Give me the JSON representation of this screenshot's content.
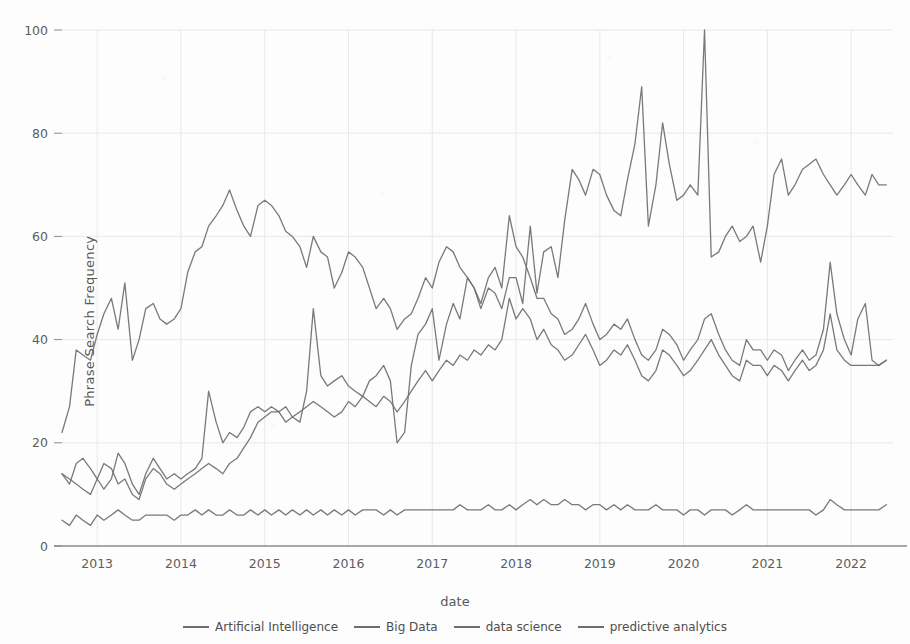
{
  "chart_data": {
    "type": "line",
    "title": "",
    "xlabel": "date",
    "ylabel": "Phrase Search Frequency",
    "ylim": [
      0,
      104
    ],
    "yticks": [
      0,
      20,
      40,
      60,
      80,
      100
    ],
    "xticks": [
      "2013",
      "2014",
      "2015",
      "2016",
      "2017",
      "2018",
      "2019",
      "2020",
      "2021",
      "2022"
    ],
    "xlim": [
      2012.58,
      2022.5
    ],
    "grid": true,
    "legend_position": "bottom",
    "line_color": "#6e6e6e",
    "axis_color": "#8a8a8a",
    "grid_color": "#e8e8e8",
    "background": "#fdfdfd",
    "x": [
      2012.58,
      2012.67,
      2012.75,
      2012.83,
      2012.92,
      2013.0,
      2013.08,
      2013.17,
      2013.25,
      2013.33,
      2013.42,
      2013.5,
      2013.58,
      2013.67,
      2013.75,
      2013.83,
      2013.92,
      2014.0,
      2014.08,
      2014.17,
      2014.25,
      2014.33,
      2014.42,
      2014.5,
      2014.58,
      2014.67,
      2014.75,
      2014.83,
      2014.92,
      2015.0,
      2015.08,
      2015.17,
      2015.25,
      2015.33,
      2015.42,
      2015.5,
      2015.58,
      2015.67,
      2015.75,
      2015.83,
      2015.92,
      2016.0,
      2016.08,
      2016.17,
      2016.25,
      2016.33,
      2016.42,
      2016.5,
      2016.58,
      2016.67,
      2016.75,
      2016.83,
      2016.92,
      2017.0,
      2017.08,
      2017.17,
      2017.25,
      2017.33,
      2017.42,
      2017.5,
      2017.58,
      2017.67,
      2017.75,
      2017.83,
      2017.92,
      2018.0,
      2018.08,
      2018.17,
      2018.25,
      2018.33,
      2018.42,
      2018.5,
      2018.58,
      2018.67,
      2018.75,
      2018.83,
      2018.92,
      2019.0,
      2019.08,
      2019.17,
      2019.25,
      2019.33,
      2019.42,
      2019.5,
      2019.58,
      2019.67,
      2019.75,
      2019.83,
      2019.92,
      2020.0,
      2020.08,
      2020.17,
      2020.25,
      2020.33,
      2020.42,
      2020.5,
      2020.58,
      2020.67,
      2020.75,
      2020.83,
      2020.92,
      2021.0,
      2021.08,
      2021.17,
      2021.25,
      2021.33,
      2021.42,
      2021.5,
      2021.58,
      2021.67,
      2021.75,
      2021.83,
      2021.92,
      2022.0,
      2022.08,
      2022.17,
      2022.25,
      2022.33,
      2022.42
    ],
    "series": [
      {
        "name": "Artificial Intelligence",
        "values": [
          14,
          12,
          16,
          17,
          15,
          13,
          11,
          13,
          18,
          16,
          12,
          10,
          14,
          17,
          15,
          13,
          14,
          13,
          14,
          15,
          17,
          30,
          24,
          20,
          22,
          21,
          23,
          26,
          27,
          26,
          27,
          26,
          24,
          25,
          24,
          30,
          46,
          33,
          31,
          32,
          33,
          31,
          30,
          29,
          32,
          33,
          35,
          32,
          20,
          22,
          35,
          41,
          43,
          46,
          36,
          43,
          47,
          44,
          52,
          50,
          46,
          50,
          49,
          46,
          52,
          52,
          47,
          62,
          49,
          57,
          58,
          52,
          63,
          73,
          71,
          68,
          73,
          72,
          68,
          65,
          64,
          71,
          78,
          89,
          62,
          70,
          82,
          74,
          67,
          68,
          70,
          68,
          100,
          56,
          57,
          60,
          62,
          59,
          60,
          62,
          55,
          62,
          72,
          75,
          68,
          70,
          73,
          74,
          75,
          72,
          70,
          68,
          70,
          72,
          70,
          68,
          72,
          70,
          70
        ]
      },
      {
        "name": "Big Data",
        "values": [
          22,
          27,
          38,
          37,
          36,
          41,
          45,
          48,
          42,
          51,
          36,
          40,
          46,
          47,
          44,
          43,
          44,
          46,
          53,
          57,
          58,
          62,
          64,
          66,
          69,
          65,
          62,
          60,
          66,
          67,
          66,
          64,
          61,
          60,
          58,
          54,
          60,
          57,
          56,
          50,
          53,
          57,
          56,
          54,
          50,
          46,
          48,
          46,
          42,
          44,
          45,
          48,
          52,
          50,
          55,
          58,
          57,
          54,
          52,
          50,
          47,
          52,
          54,
          50,
          64,
          58,
          56,
          52,
          48,
          48,
          45,
          44,
          41,
          42,
          44,
          47,
          43,
          40,
          41,
          43,
          42,
          44,
          40,
          37,
          36,
          38,
          42,
          41,
          39,
          36,
          38,
          40,
          44,
          45,
          41,
          38,
          36,
          35,
          40,
          38,
          38,
          36,
          38,
          37,
          34,
          36,
          38,
          36,
          37,
          42,
          55,
          45,
          40,
          37,
          44,
          47,
          36,
          35,
          36
        ]
      },
      {
        "name": "data science",
        "values": [
          14,
          13,
          12,
          11,
          10,
          13,
          16,
          15,
          12,
          13,
          10,
          9,
          13,
          15,
          14,
          12,
          11,
          12,
          13,
          14,
          15,
          16,
          15,
          14,
          16,
          17,
          19,
          21,
          24,
          25,
          26,
          26,
          27,
          25,
          26,
          27,
          28,
          27,
          26,
          25,
          26,
          28,
          27,
          29,
          28,
          27,
          29,
          28,
          26,
          28,
          30,
          32,
          34,
          32,
          34,
          36,
          35,
          37,
          36,
          38,
          37,
          39,
          38,
          40,
          48,
          44,
          46,
          44,
          40,
          42,
          39,
          38,
          36,
          37,
          39,
          41,
          38,
          35,
          36,
          38,
          37,
          39,
          36,
          33,
          32,
          34,
          38,
          37,
          35,
          33,
          34,
          36,
          38,
          40,
          37,
          35,
          33,
          32,
          36,
          35,
          35,
          33,
          35,
          34,
          32,
          34,
          36,
          34,
          35,
          38,
          45,
          38,
          36,
          35,
          35,
          35,
          35,
          35,
          36
        ]
      },
      {
        "name": "predictive analytics",
        "values": [
          5,
          4,
          6,
          5,
          4,
          6,
          5,
          6,
          7,
          6,
          5,
          5,
          6,
          6,
          6,
          6,
          5,
          6,
          6,
          7,
          6,
          7,
          6,
          6,
          7,
          6,
          6,
          7,
          6,
          7,
          6,
          7,
          6,
          7,
          6,
          7,
          6,
          7,
          6,
          7,
          6,
          7,
          6,
          7,
          7,
          7,
          6,
          7,
          6,
          7,
          7,
          7,
          7,
          7,
          7,
          7,
          7,
          8,
          7,
          7,
          7,
          8,
          7,
          7,
          8,
          7,
          8,
          9,
          8,
          9,
          8,
          8,
          9,
          8,
          8,
          7,
          8,
          8,
          7,
          8,
          7,
          8,
          7,
          7,
          7,
          8,
          7,
          7,
          7,
          6,
          7,
          7,
          6,
          7,
          7,
          7,
          6,
          7,
          8,
          7,
          7,
          7,
          7,
          7,
          7,
          7,
          7,
          7,
          6,
          7,
          9,
          8,
          7,
          7,
          7,
          7,
          7,
          7,
          8
        ]
      }
    ]
  }
}
